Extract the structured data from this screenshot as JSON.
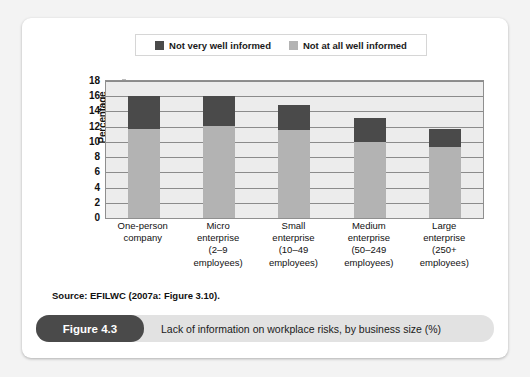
{
  "figure": {
    "badge": "Figure 4.3",
    "caption": "Lack of information on workplace risks, by business size (%)",
    "source": "Source: EFILWC (2007a: Figure 3.10)."
  },
  "colors": {
    "dark_series": "#4a4a4a",
    "light_series": "#b3b3b3",
    "plot_background": "#ececec",
    "caption_bar": "#e2e2e2",
    "badge": "#4a4a4a"
  },
  "legend": {
    "entries": [
      {
        "label": "Not very well informed",
        "swatch": "dark"
      },
      {
        "label": "Not at all well informed",
        "swatch": "light"
      }
    ]
  },
  "chart_data": {
    "type": "bar",
    "stacked": true,
    "title": "Lack of information on workplace risks, by business size (%)",
    "xlabel": "",
    "ylabel": "Percentage",
    "ylim": [
      0,
      18
    ],
    "yticks": [
      0,
      2,
      4,
      6,
      8,
      10,
      12,
      14,
      16,
      18
    ],
    "ytick_labels": [
      "0",
      "2",
      "4",
      "6",
      "8",
      "10",
      "12",
      "14",
      "16",
      "18"
    ],
    "grid": true,
    "legend_position": "top",
    "categories": [
      "One-person company",
      "Micro enterprise (2–9 employees)",
      "Small enterprise (10–49 employees)",
      "Medium enterprise (50–249 employees)",
      "Large enterprise (250+ employees)"
    ],
    "category_lines": [
      [
        "One-person",
        "company"
      ],
      [
        "Micro",
        "enterprise",
        "(2–9",
        "employees)"
      ],
      [
        "Small",
        "enterprise",
        "(10–49",
        "employees)"
      ],
      [
        "Medium",
        "enterprise",
        "(50–249",
        "employees)"
      ],
      [
        "Large",
        "enterprise",
        "(250+",
        "employees)"
      ]
    ],
    "series": [
      {
        "name": "Not at all well informed",
        "color": "#b3b3b3",
        "values": [
          11.7,
          12.1,
          11.6,
          10.0,
          9.3
        ]
      },
      {
        "name": "Not very well informed",
        "color": "#4a4a4a",
        "values": [
          4.3,
          3.9,
          3.2,
          3.2,
          2.4
        ]
      }
    ],
    "totals": [
      16.0,
      16.0,
      14.8,
      13.2,
      11.7
    ]
  }
}
